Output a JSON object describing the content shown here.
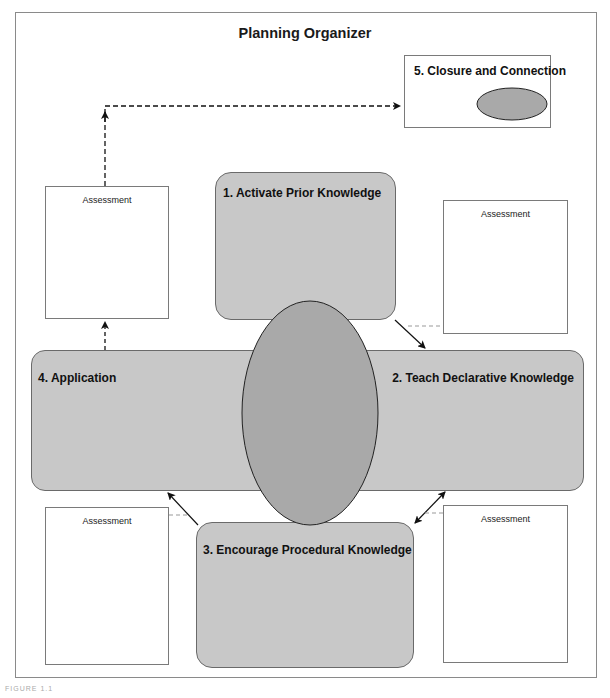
{
  "title": "Planning Organizer",
  "stages": {
    "s1": {
      "label": "1. Activate Prior Knowledge"
    },
    "s2": {
      "label": "2. Teach Declarative Knowledge"
    },
    "s3": {
      "label": "3. Encourage Procedural Knowledge"
    },
    "s4": {
      "label": "4. Application"
    },
    "s5": {
      "label": "5. Closure and Connection"
    }
  },
  "assessments": {
    "top_left": {
      "label": "Assessment"
    },
    "top_right": {
      "label": "Assessment"
    },
    "bottom_left": {
      "label": "Assessment"
    },
    "bottom_right": {
      "label": "Assessment"
    }
  },
  "caption": "FIGURE 1.1",
  "colors": {
    "stage_fill": "#c8c8c8",
    "ellipse_fill": "#a9a9a9",
    "border": "#6a6a6a",
    "arrow": "#111111"
  }
}
